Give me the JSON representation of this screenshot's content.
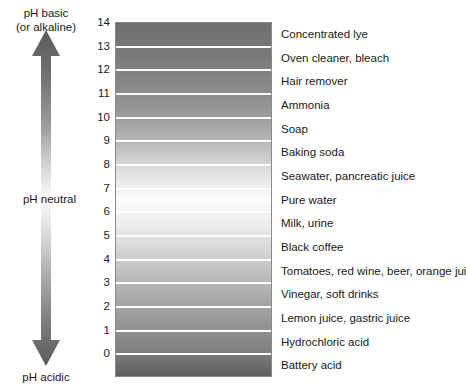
{
  "chart_data": {
    "type": "bar",
    "xlabel": "",
    "ylabel": "pH",
    "ylim": [
      0,
      14
    ],
    "grid": false,
    "legend_position": "none",
    "axis_label_top": "pH basic (or alkaline)",
    "axis_label_middle": "pH neutral",
    "axis_label_bottom": "pH acidic",
    "categories": [
      14,
      13,
      12,
      11,
      10,
      9,
      8,
      7,
      6,
      5,
      4,
      3,
      2,
      1,
      0
    ],
    "band_labels": [
      "Concentrated lye",
      "Oven cleaner, bleach",
      "Hair remover",
      "Ammonia",
      "Soap",
      "Baking soda",
      "Seawater, pancreatic juice",
      "Pure water",
      "Milk, urine",
      "Black coffee",
      "Tomatoes, red wine, beer, orange juice",
      "Vinegar, soft drinks",
      "Lemon juice, gastric juice",
      "Hydrochloric acid",
      "Battery acid"
    ],
    "bands": [
      {
        "ph_top": 14,
        "ph_bottom": 13,
        "label": "Concentrated lye",
        "tone": "#6e6e6e"
      },
      {
        "ph_top": 13,
        "ph_bottom": 12,
        "label": "Oven cleaner, bleach",
        "tone": "#777777"
      },
      {
        "ph_top": 12,
        "ph_bottom": 11,
        "label": "Hair remover",
        "tone": "#828282"
      },
      {
        "ph_top": 11,
        "ph_bottom": 10,
        "label": "Ammonia",
        "tone": "#8f8f8f"
      },
      {
        "ph_top": 10,
        "ph_bottom": 9,
        "label": "Soap",
        "tone": "#a3a3a3"
      },
      {
        "ph_top": 9,
        "ph_bottom": 8,
        "label": "Baking soda",
        "tone": "#c2c2c2"
      },
      {
        "ph_top": 8,
        "ph_bottom": 7,
        "label": "Seawater, pancreatic juice",
        "tone": "#e2e2e2"
      },
      {
        "ph_top": 7,
        "ph_bottom": 6,
        "label": "Pure water",
        "tone": "#fcfcfc"
      },
      {
        "ph_top": 6,
        "ph_bottom": 5,
        "label": "Milk, urine",
        "tone": "#ededed"
      },
      {
        "ph_top": 5,
        "ph_bottom": 4,
        "label": "Black coffee",
        "tone": "#d6d6d6"
      },
      {
        "ph_top": 4,
        "ph_bottom": 3,
        "label": "Tomatoes, red wine, beer, orange juice",
        "tone": "#bdbdbd"
      },
      {
        "ph_top": 3,
        "ph_bottom": 2,
        "label": "Vinegar, soft drinks",
        "tone": "#a8a8a8"
      },
      {
        "ph_top": 2,
        "ph_bottom": 1,
        "label": "Lemon juice, gastric juice",
        "tone": "#949494"
      },
      {
        "ph_top": 1,
        "ph_bottom": 0,
        "label": "Hydrochloric acid",
        "tone": "#7f7f7f"
      },
      {
        "ph_top": 0,
        "ph_bottom": -1,
        "label": "Battery acid",
        "tone": "#5e5e5e"
      }
    ],
    "colors": {
      "most_basic": "#6e6e6e",
      "neutral": "#fcfcfc",
      "most_acidic": "#5e5e5e",
      "separator": "#fdfdfd",
      "border": "#8a8a8a",
      "text": "#1a1a1a"
    }
  },
  "axis": {
    "top_label_line1": "pH basic",
    "top_label_line2": "(or alkaline)",
    "middle_label": "pH neutral",
    "bottom_label": "pH acidic",
    "ticks": [
      "14",
      "13",
      "12",
      "11",
      "10",
      "9",
      "8",
      "7",
      "6",
      "5",
      "4",
      "3",
      "2",
      "1",
      "0"
    ]
  }
}
